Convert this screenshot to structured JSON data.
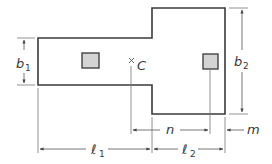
{
  "diagram": {
    "colors": {
      "outline": "#3a3a3a",
      "dimension": "#555555",
      "column_fill": "#d4d4d4",
      "column_stroke": "#444444",
      "background": "#ffffff"
    },
    "labels": {
      "b1": {
        "main": "b",
        "sub": "1"
      },
      "b2": {
        "main": "b",
        "sub": "2"
      },
      "centroid": "C",
      "n": "n",
      "m": "m",
      "l1": {
        "main": "ℓ",
        "sub": "1"
      },
      "l2": {
        "main": "ℓ",
        "sub": "2"
      }
    }
  }
}
